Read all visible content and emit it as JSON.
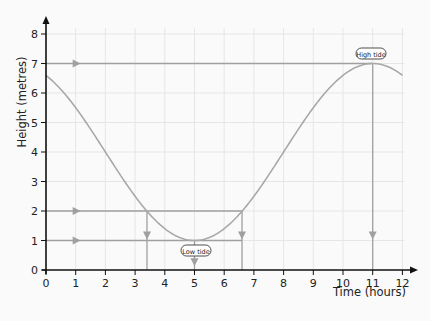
{
  "chart_data": {
    "type": "line",
    "title": "",
    "xlabel": "Time (hours)",
    "ylabel": "Height (metres)",
    "xlim": [
      0,
      12
    ],
    "ylim": [
      0,
      8
    ],
    "x_ticks": [
      0,
      1,
      2,
      3,
      4,
      5,
      6,
      7,
      8,
      9,
      10,
      11,
      12
    ],
    "y_ticks": [
      0,
      1,
      2,
      3,
      4,
      5,
      6,
      7,
      8
    ],
    "grid": true,
    "legend": null,
    "series": [
      {
        "name": "Tide height",
        "x": [
          0,
          1,
          2,
          3,
          4,
          5,
          6,
          7,
          8,
          9,
          10,
          11,
          12
        ],
        "values": [
          6.6,
          5.5,
          4.0,
          2.5,
          1.4,
          1.0,
          1.4,
          2.5,
          4.0,
          5.5,
          6.6,
          7.0,
          6.6
        ],
        "color": "#a8a8a8"
      }
    ],
    "reference_lines": [
      {
        "type": "horizontal",
        "y": 7,
        "from_x": 0,
        "to_x": 11,
        "arrow_at_x": 1
      },
      {
        "type": "vertical",
        "x": 11,
        "from_y": 7,
        "to_y": 0,
        "arrow_at_y": 1.2
      },
      {
        "type": "horizontal",
        "y": 2,
        "from_x": 0,
        "to_x": 6.6,
        "arrow_at_x": 1
      },
      {
        "type": "horizontal",
        "y": 1,
        "from_x": 0,
        "to_x": 6.6,
        "arrow_at_x": 1
      },
      {
        "type": "vertical",
        "x": 3.4,
        "from_y": 2,
        "to_y": 0,
        "arrow_at_y": 1.2
      },
      {
        "type": "vertical",
        "x": 6.6,
        "from_y": 2,
        "to_y": 0,
        "arrow_at_y": 1.2
      },
      {
        "type": "vertical",
        "x": 5,
        "from_y": 1,
        "to_y": 0,
        "arrow_at_y": 0.3
      }
    ],
    "annotations": [
      {
        "text": "High tide",
        "x": 11,
        "y": 7
      },
      {
        "text": "Low tide",
        "x": 5,
        "y": 1
      }
    ],
    "colors": {
      "axis": "#111111",
      "grid": "#e6e6e6",
      "curve": "#a8a8a8",
      "reference": "#a0a0a0"
    }
  },
  "labels": {
    "x_axis_title": "Time (hours)",
    "y_axis_title": "Height (metres)",
    "high_tide": "High tide",
    "low_tide": "Low tide",
    "x_ticks": [
      "0",
      "1",
      "2",
      "3",
      "4",
      "5",
      "6",
      "7",
      "8",
      "9",
      "10",
      "11",
      "12"
    ],
    "y_ticks": [
      "0",
      "1",
      "2",
      "3",
      "4",
      "5",
      "6",
      "7",
      "8"
    ]
  }
}
